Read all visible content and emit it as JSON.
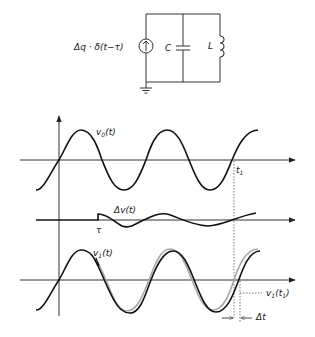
{
  "circuit": {
    "source_label": "Δq · δ(t−τ)",
    "capacitor_label": "C",
    "inductor_label": "L",
    "source_icon": "current-source-up-arrow-icon",
    "ground_icon": "ground-icon"
  },
  "plot_top": {
    "signal_label": "v0(t)",
    "marker_label": "t1"
  },
  "plot_middle": {
    "signal_label": "Δv(t)",
    "marker_label": "τ"
  },
  "plot_bottom": {
    "signal_label": "v1(t)",
    "value_label": "v1(t1)",
    "delta_label": "Δt"
  },
  "colors": {
    "line": "#111111",
    "reference_wave": "#a8a8a8",
    "background": "#ffffff"
  }
}
